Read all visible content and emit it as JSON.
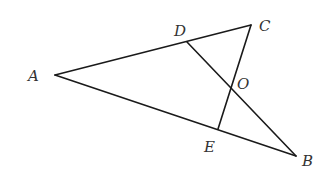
{
  "diagram": {
    "type": "geometry",
    "stroke_color": "#1a1a1a",
    "label_color": "#333333",
    "points": {
      "A": {
        "label": "A",
        "x": 55,
        "y": 75,
        "lx": 28,
        "ly": 81
      },
      "B": {
        "label": "B",
        "x": 296,
        "y": 156,
        "lx": 302,
        "ly": 166
      },
      "C": {
        "label": "C",
        "x": 251,
        "y": 25,
        "lx": 259,
        "ly": 31
      },
      "D": {
        "label": "D",
        "x": 187,
        "y": 42,
        "lx": 174,
        "ly": 36
      },
      "E": {
        "label": "E",
        "x": 218,
        "y": 129,
        "lx": 204,
        "ly": 152
      },
      "O": {
        "label": "O",
        "x": 232,
        "y": 87,
        "lx": 237,
        "ly": 89
      }
    },
    "segments": [
      {
        "name": "segment-AC",
        "from": "A",
        "to": "C"
      },
      {
        "name": "segment-AB",
        "from": "A",
        "to": "B"
      },
      {
        "name": "segment-CE",
        "from": "C",
        "to": "E"
      },
      {
        "name": "segment-DB",
        "from": "D",
        "to": "B"
      }
    ]
  }
}
